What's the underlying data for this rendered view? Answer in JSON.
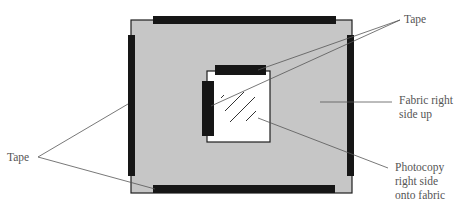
{
  "diagram": {
    "type": "labeled illustration",
    "colors": {
      "fabric": "#c6c6c6",
      "tape": "#161616",
      "photocopy": "#ffffff",
      "outline": "#1e1e1e",
      "leader_line": "#555555",
      "label_text": "#555555"
    },
    "labels": {
      "tape_top": "Tape",
      "fabric": "Fabric right\nside up",
      "photocopy": "Photocopy\nright side\nonto fabric",
      "tape_left": "Tape"
    }
  }
}
